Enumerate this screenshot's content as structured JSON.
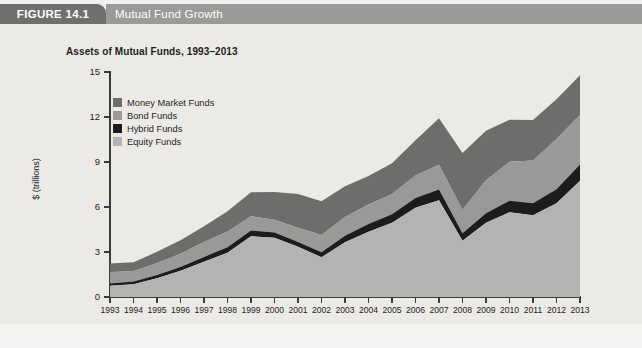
{
  "header": {
    "figure_number": "FIGURE 14.1",
    "figure_title": "Mutual Fund Growth",
    "tab_color": "#6f6f6f",
    "bar_color": "#9a9a98"
  },
  "chart_data": {
    "type": "area",
    "stacked": true,
    "title": "Assets of Mutual Funds, 1993–2013",
    "xlabel": "Year",
    "ylabel": "$ (trillions)",
    "ylim": [
      0,
      15
    ],
    "yticks": [
      0,
      3,
      6,
      9,
      12,
      15
    ],
    "grid": false,
    "legend_position": "top-left inside plot",
    "categories": [
      "1993",
      "1994",
      "1995",
      "1996",
      "1997",
      "1998",
      "1999",
      "2000",
      "2001",
      "2002",
      "2003",
      "2004",
      "2005",
      "2006",
      "2007",
      "2008",
      "2009",
      "2010",
      "2011",
      "2012",
      "2013"
    ],
    "series": [
      {
        "name": "Equity Funds",
        "color": "#b4b3b1",
        "values": [
          0.75,
          0.85,
          1.25,
          1.75,
          2.35,
          2.95,
          4.05,
          3.95,
          3.35,
          2.65,
          3.65,
          4.35,
          4.95,
          5.95,
          6.45,
          3.75,
          4.95,
          5.65,
          5.45,
          6.25,
          7.75
        ]
      },
      {
        "name": "Hybrid Funds",
        "color": "#1c1c1c",
        "values": [
          0.15,
          0.18,
          0.21,
          0.25,
          0.32,
          0.36,
          0.38,
          0.35,
          0.32,
          0.33,
          0.43,
          0.52,
          0.57,
          0.65,
          0.72,
          0.5,
          0.64,
          0.77,
          0.8,
          0.93,
          1.08
        ]
      },
      {
        "name": "Bond Funds",
        "color": "#9a9997",
        "values": [
          0.76,
          0.68,
          0.8,
          0.88,
          1.0,
          1.05,
          0.95,
          0.85,
          0.95,
          1.15,
          1.25,
          1.3,
          1.35,
          1.5,
          1.65,
          1.55,
          2.2,
          2.6,
          2.85,
          3.35,
          3.3
        ]
      },
      {
        "name": "Money Market Funds",
        "color": "#6d6d6b",
        "values": [
          0.57,
          0.6,
          0.75,
          0.9,
          1.05,
          1.35,
          1.6,
          1.85,
          2.25,
          2.25,
          2.05,
          1.9,
          2.05,
          2.35,
          3.1,
          3.8,
          3.3,
          2.8,
          2.7,
          2.65,
          2.65
        ]
      }
    ]
  }
}
